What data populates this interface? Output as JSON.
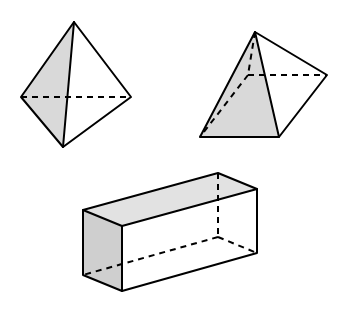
{
  "figure": {
    "width": 344,
    "height": 315,
    "background": "#ffffff",
    "line_color": "#000000",
    "shade_color": "#d9d9d9",
    "shapes": [
      {
        "name": "tetrahedron",
        "vertices": {
          "apex": [
            74,
            22
          ],
          "left": [
            21,
            97
          ],
          "right": [
            131,
            97
          ],
          "bottom": [
            63,
            147
          ]
        },
        "shaded_face": [
          "apex",
          "left",
          "bottom"
        ],
        "hidden_edges": [
          [
            "left",
            "right"
          ]
        ]
      },
      {
        "name": "square-pyramid",
        "vertices": {
          "apex": [
            255,
            32
          ],
          "back": [
            248,
            75
          ],
          "right": [
            327,
            75
          ],
          "front_left": [
            200,
            137
          ],
          "front_right": [
            279,
            137
          ]
        },
        "shaded_face": [
          "apex",
          "front_left",
          "front_right"
        ],
        "hidden_edges": [
          [
            "apex",
            "back"
          ],
          [
            "back",
            "right"
          ],
          [
            "back",
            "front_left"
          ]
        ]
      },
      {
        "name": "rectangular-prism",
        "vertices": {
          "ftl": [
            83,
            210
          ],
          "ftr": [
            122,
            226
          ],
          "fbl": [
            83,
            275
          ],
          "fbr": [
            122,
            291
          ],
          "btl": [
            218,
            173
          ],
          "btr": [
            257,
            189
          ],
          "bbr": [
            257,
            253
          ],
          "bbl": [
            218,
            237
          ]
        },
        "shaded_faces": [
          [
            "ftl",
            "ftr",
            "fbr",
            "fbl"
          ],
          [
            "ftl",
            "btl",
            "btr",
            "ftr"
          ]
        ],
        "hidden_edges": [
          [
            "btl",
            "bbl"
          ],
          [
            "bbl",
            "bbr"
          ],
          [
            "bbl",
            "fbl"
          ]
        ]
      }
    ]
  }
}
